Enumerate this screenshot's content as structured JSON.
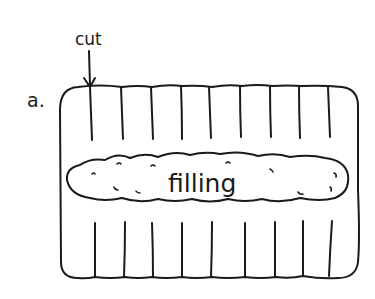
{
  "figure": {
    "part_label": "a.",
    "cut_label": "cut",
    "filling_label": "filling",
    "ink_color": "#1a1a1a",
    "background_color": "#ffffff"
  },
  "dough": {
    "shape": "rounded-rectangle",
    "top_cut_count": 9,
    "bottom_cut_count": 9
  },
  "icons": {
    "arrow": "down-arrow-icon"
  }
}
